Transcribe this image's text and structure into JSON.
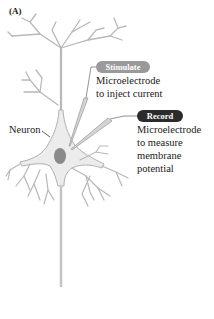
{
  "figure": {
    "panel_label": "(A)",
    "neuron_label": "Neuron",
    "stimulate": {
      "badge": "Stimulate",
      "line1": "Microelectrode",
      "line2": "to inject current",
      "badge_color": "#9a9a9a"
    },
    "record": {
      "badge": "Record",
      "line1": "Microelectrode",
      "line2": "to measure",
      "line3": "membrane",
      "line4": "potential",
      "badge_color": "#2b2b2b"
    },
    "colors": {
      "neuron_fill": "#ececec",
      "neuron_outline": "#b0b0b0",
      "nucleus": "#8a8a8a"
    }
  }
}
